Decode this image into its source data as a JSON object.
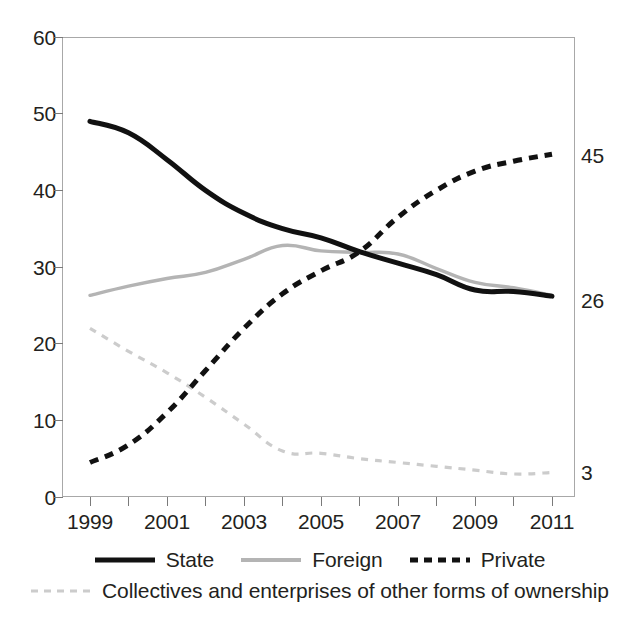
{
  "chart_data": {
    "type": "line",
    "title": "",
    "subtitle": "",
    "xlabel": "",
    "ylabel": "",
    "xlim": [
      1999,
      2011
    ],
    "ylim": [
      0,
      60
    ],
    "grid": false,
    "legend_position": "bottom",
    "x": [
      1999,
      2000,
      2001,
      2002,
      2003,
      2004,
      2005,
      2006,
      2007,
      2008,
      2009,
      2010,
      2011
    ],
    "x_tick_labels": [
      "1999",
      "2001",
      "2003",
      "2005",
      "2007",
      "2009",
      "2011"
    ],
    "y_tick_labels": [
      "0",
      "10",
      "20",
      "30",
      "40",
      "50",
      "60"
    ],
    "series": [
      {
        "name": "State",
        "style": "solid",
        "color": "#111111",
        "end_label": "26",
        "values": [
          49.0,
          47.5,
          44.0,
          40.0,
          37.0,
          35.0,
          33.8,
          32.0,
          30.5,
          29.0,
          27.0,
          26.8,
          26.2
        ]
      },
      {
        "name": "Foreign",
        "style": "solid",
        "color": "#b4b4b4",
        "end_label": "",
        "values": [
          26.3,
          27.5,
          28.5,
          29.3,
          31.0,
          32.8,
          32.1,
          31.9,
          31.7,
          29.8,
          28.0,
          27.3,
          26.3
        ]
      },
      {
        "name": "Private",
        "style": "dashed",
        "color": "#111111",
        "end_label": "45",
        "values": [
          4.5,
          6.8,
          11.0,
          16.5,
          22.0,
          26.5,
          29.5,
          32.0,
          36.5,
          40.0,
          42.5,
          43.8,
          44.7
        ]
      },
      {
        "name": "Collectives and enterprises of other forms of ownership",
        "style": "dashed",
        "color": "#cccccc",
        "end_label": "3",
        "values": [
          22.0,
          19.0,
          16.2,
          13.0,
          9.5,
          6.0,
          5.7,
          5.0,
          4.5,
          4.0,
          3.5,
          3.0,
          3.2
        ]
      }
    ],
    "end_labels": [
      {
        "series": "Private",
        "text": "45",
        "value": 45
      },
      {
        "series": "State",
        "text": "26",
        "value": 26
      },
      {
        "series": "Collectives and enterprises of other forms of ownership",
        "text": "3",
        "value": 3
      }
    ],
    "legend": [
      {
        "label": "State",
        "style": "solid",
        "color": "#111111"
      },
      {
        "label": "Foreign",
        "style": "solid",
        "color": "#b4b4b4"
      },
      {
        "label": "Private",
        "style": "dashed",
        "color": "#111111"
      },
      {
        "label": "Collectives and enterprises of other forms of ownership",
        "style": "dashed",
        "color": "#cccccc"
      }
    ]
  }
}
